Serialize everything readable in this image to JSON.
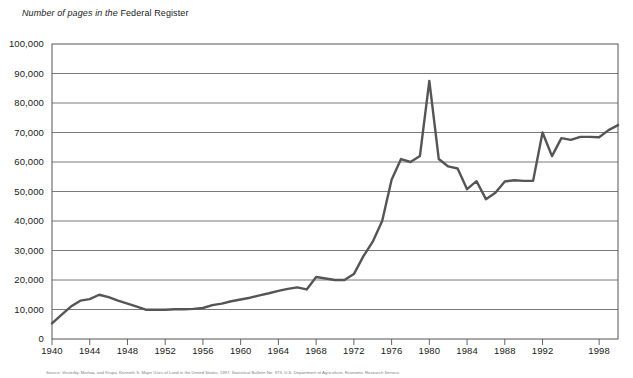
{
  "chart_data": {
    "type": "line",
    "title": "Number of pages in the Federal Register",
    "title_italic_part": "Number of pages in the",
    "title_upright_part": "Federal Register",
    "xlabel": "",
    "ylabel": "",
    "xlim": [
      1940,
      2000
    ],
    "ylim": [
      0,
      100000
    ],
    "grid": true,
    "legend": "none",
    "line_color": "#555555",
    "x_tick_labels": [
      "1940",
      "1944",
      "1948",
      "1952",
      "1956",
      "1960",
      "1964",
      "1968",
      "1972",
      "1976",
      "1980",
      "1984",
      "1988",
      "1992",
      "1998"
    ],
    "x_tick_values": [
      1940,
      1944,
      1948,
      1952,
      1956,
      1960,
      1964,
      1968,
      1972,
      1976,
      1980,
      1984,
      1988,
      1992,
      1998
    ],
    "y_tick_labels": [
      "0",
      "10,000",
      "20,000",
      "30,000",
      "40,000",
      "50,000",
      "60,000",
      "70,000",
      "80,000",
      "90,000",
      "100,000"
    ],
    "y_tick_values": [
      0,
      10000,
      20000,
      30000,
      40000,
      50000,
      60000,
      70000,
      80000,
      90000,
      100000
    ],
    "x": [
      1940,
      1941,
      1942,
      1943,
      1944,
      1945,
      1946,
      1947,
      1948,
      1949,
      1950,
      1951,
      1952,
      1953,
      1954,
      1955,
      1956,
      1957,
      1958,
      1959,
      1960,
      1961,
      1962,
      1963,
      1964,
      1965,
      1966,
      1967,
      1968,
      1969,
      1970,
      1971,
      1972,
      1973,
      1974,
      1975,
      1976,
      1977,
      1978,
      1979,
      1980,
      1981,
      1982,
      1983,
      1984,
      1985,
      1986,
      1987,
      1988,
      1989,
      1990,
      1991,
      1992,
      1993,
      1994,
      1995,
      1996,
      1997,
      1998,
      1999,
      2000
    ],
    "values": [
      5300,
      8200,
      11000,
      13000,
      13500,
      15000,
      14200,
      13000,
      12000,
      11000,
      9900,
      9900,
      9900,
      10100,
      10100,
      10200,
      10500,
      11500,
      12000,
      12800,
      13400,
      14000,
      14800,
      15500,
      16300,
      17000,
      17500,
      16800,
      21000,
      20500,
      20000,
      20000,
      22000,
      28000,
      33000,
      40000,
      54000,
      61000,
      60000,
      62000,
      87500,
      61000,
      58500,
      57800,
      50800,
      53500,
      47400,
      49600,
      53400,
      53800,
      53600,
      53600,
      70000,
      62000,
      68100,
      67500,
      68500,
      68500,
      68400,
      70800,
      72500
    ],
    "source_note": "Source: Vesterby, Marlow, and Krupa, Kenneth S. Major Uses of Land in the United States, 1997, Statistical Bulletin No. 973, U.S. Department of Agriculture, Economic Research Service."
  }
}
